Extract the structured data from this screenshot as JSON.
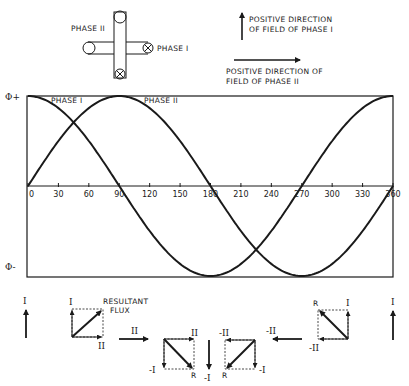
{
  "coil_diagram": {
    "label_phase_2": "PHASE II",
    "label_phase_1": "PHASE I",
    "phase_1_marker": "cross-in-circle (into page)",
    "phase_2_marker": "open circle (out of page)"
  },
  "legend": {
    "phase_1_direction_line1": "POSITIVE DIRECTION",
    "phase_1_direction_line2": "OF FIELD OF PHASE I",
    "phase_2_direction_line1": "POSITIVE DIRECTION OF",
    "phase_2_direction_line2": "FIELD OF PHASE II"
  },
  "plot": {
    "y_top_label": "Φ+",
    "y_bottom_label": "Φ-",
    "curve_label_1": "PHASE I",
    "curve_label_2": "PHASE II",
    "x_ticks": [
      "0",
      "30",
      "60",
      "90",
      "120",
      "150",
      "180",
      "210",
      "240",
      "270",
      "300",
      "330",
      "360"
    ]
  },
  "chart_data": {
    "type": "line",
    "title": "",
    "xlabel": "electrical degrees",
    "ylabel": "flux",
    "x": [
      0,
      30,
      60,
      90,
      120,
      150,
      180,
      210,
      240,
      270,
      300,
      330,
      360
    ],
    "series": [
      {
        "name": "PHASE I",
        "function": "cos(x)",
        "values": [
          1,
          0.866,
          0.5,
          0,
          -0.5,
          -0.866,
          -1,
          -0.866,
          -0.5,
          0,
          0.5,
          0.866,
          1
        ]
      },
      {
        "name": "PHASE II",
        "function": "sin(x)",
        "values": [
          0,
          0.5,
          0.866,
          1,
          0.866,
          0.5,
          0,
          -0.5,
          -0.866,
          -1,
          -0.866,
          -0.5,
          0
        ]
      }
    ],
    "y_axis_labels": [
      "Φ+",
      "Φ-"
    ],
    "xlim": [
      0,
      360
    ],
    "ylim": [
      -1,
      1
    ],
    "grid": false
  },
  "vectors": {
    "left_arrow_label": "I",
    "right_arrow_label": "I",
    "resultant_label_line1": "RESULTANT",
    "resultant_label_line2": "FLUX",
    "diagram1": {
      "vertical": "I",
      "horizontal": "II"
    },
    "transition1": "II",
    "diagram2": {
      "vertical": "-I",
      "horizontal": "II",
      "resultant": "R"
    },
    "middle_arrow_label": "-I",
    "diagram3": {
      "vertical": "-I",
      "horizontal": "-II",
      "resultant": "R"
    },
    "transition2": "-II",
    "diagram4": {
      "vertical": "I",
      "horizontal": "-II",
      "resultant": "R"
    }
  }
}
